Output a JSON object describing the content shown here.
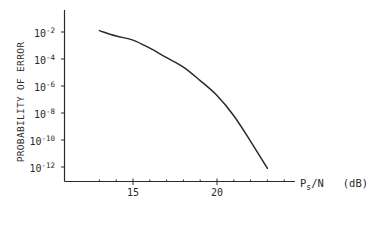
{
  "chart_data": {
    "type": "line",
    "title": "",
    "xlabel": "P_s/N (dB)",
    "xlabel_main": "P",
    "xlabel_sub": "s",
    "xlabel_rest": "/N   (dB)",
    "ylabel": "PROBABILITY OF ERROR",
    "yscale": "log",
    "xlim": [
      11,
      24.7
    ],
    "ylim_exponent": [
      -13.1,
      -0.4
    ],
    "grid": false,
    "legend": null,
    "x_ticks_major": [
      15,
      20
    ],
    "x_ticks_minor": [
      13,
      14,
      16,
      17,
      18,
      19,
      21,
      22,
      23,
      24
    ],
    "x_tick_labels": [
      "15",
      "20"
    ],
    "y_ticks_exponent": [
      -2,
      -4,
      -6,
      -8,
      -10,
      -12
    ],
    "y_tick_labels": [
      "10^-2",
      "10^-4",
      "10^-6",
      "10^-8",
      "10^-10",
      "10^-12"
    ],
    "series": [
      {
        "name": "Probability of error",
        "x": [
          13,
          14,
          15,
          16,
          17,
          18,
          19,
          20,
          21,
          22,
          23
        ],
        "y": [
          0.013,
          0.005,
          0.0025,
          0.0006,
          0.00013,
          2.5e-05,
          2.5e-06,
          2e-07,
          6e-09,
          8e-11,
          8e-13
        ],
        "y_exponent": [
          -1.9,
          -2.3,
          -2.6,
          -3.2,
          -3.9,
          -4.6,
          -5.6,
          -6.7,
          -8.2,
          -10.1,
          -12.1
        ]
      }
    ]
  },
  "axes": {
    "y_tick_exps": [
      "-2",
      "-4",
      "-6",
      "-8",
      "-10",
      "-12"
    ],
    "y_tick_base": "10",
    "x_tick_15": "15",
    "x_tick_20": "20"
  },
  "colors": {
    "ink": "#2a2a2a",
    "background": "#ffffff"
  }
}
